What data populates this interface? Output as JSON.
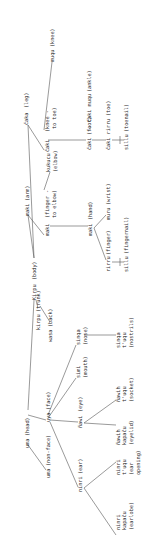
{
  "diagram": {
    "orientation": "rotated 90deg counterclockwise",
    "nodes": {
      "body": {
        "term": "Kirpu",
        "gloss": "(body)"
      },
      "leg": {
        "term": "čaka",
        "gloss": "(leg)"
      },
      "knee_to_toe": {
        "term": "čaki",
        "gloss1": "(knee -",
        "gloss2": "to toe)"
      },
      "knee": {
        "term": "muqu",
        "gloss": "(knee)"
      },
      "foot": {
        "term": "čaki",
        "gloss": "(foot)"
      },
      "ankle": {
        "term": "čaki muqu",
        "gloss": "(ankle)"
      },
      "toe": {
        "term": "čaki rirru",
        "gloss": "(toe)"
      },
      "toenail": {
        "term": "sillu",
        "gloss": "(toenail)"
      },
      "arm": {
        "term": "maki",
        "gloss": "(arm)"
      },
      "finger_to_elbow": {
        "term": "maki",
        "gloss1": "(finger -",
        "gloss2": "to elbow)"
      },
      "elbow": {
        "term": "kukucu",
        "gloss": "(elbow)"
      },
      "hand": {
        "term": "maki",
        "gloss": "(hand)"
      },
      "finger": {
        "term": "rirru",
        "gloss": "(finger)"
      },
      "wrist": {
        "term": "muru",
        "gloss": "(wrist)"
      },
      "fingernail": {
        "term": "sillu",
        "gloss": "(fingernail)"
      },
      "trunk": {
        "term": "kirpu",
        "gloss": "(trunk)"
      },
      "back": {
        "term": "wasa",
        "gloss": "(back)"
      },
      "head": {
        "term": "uma",
        "gloss": "(head)"
      },
      "non_face": {
        "term": "uma",
        "gloss": "(non-face)"
      },
      "face": {
        "term": "uya",
        "gloss": "(face)"
      },
      "nose": {
        "term": "sinqa",
        "gloss": "(nose)"
      },
      "nostrils": {
        "line1": "sinqa",
        "line2": "t'uqu",
        "gloss": "(nostrils)"
      },
      "mouth": {
        "term": "simi",
        "gloss": "(mouth)"
      },
      "eye": {
        "term": "ñawi",
        "gloss": "(eye)"
      },
      "socket": {
        "line1": "ñawih",
        "line2": "t'uqu",
        "gloss": "(socket)"
      },
      "eyelid": {
        "line1": "ñawih",
        "line2": "kapaču",
        "gloss": "(eyelid)"
      },
      "ear": {
        "term": "ninri",
        "gloss": "(ear)"
      },
      "ear_opening": {
        "line1": "ninri",
        "line2": "t'uqu",
        "gloss1": "(ear",
        "gloss2": "opening)"
      },
      "earlobe": {
        "line1": "ninri",
        "line2": "kapaču",
        "gloss": "(earlobe)"
      }
    }
  }
}
